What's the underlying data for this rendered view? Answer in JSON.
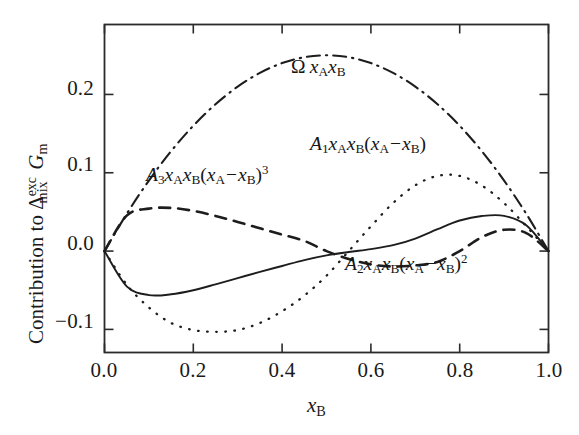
{
  "chart_data": {
    "type": "line",
    "title": "",
    "xlabel": "x_B",
    "ylabel": "Contribution to Δ_mix^exc G_m",
    "xlim": [
      0.0,
      1.0
    ],
    "ylim": [
      -0.1295,
      0.2893
    ],
    "grid": false,
    "legend_position": "inline-annotations",
    "xticks": [
      "0.0",
      "0.2",
      "0.4",
      "0.6",
      "0.8",
      "1.0"
    ],
    "xtick_values": [
      0.0,
      0.2,
      0.4,
      0.6,
      0.8,
      1.0
    ],
    "yticks": [
      "0.2",
      "0.1",
      "0.0",
      "−0.1"
    ],
    "ytick_values": [
      0.2,
      0.1,
      0.0,
      -0.1
    ],
    "x": [
      0.0,
      0.05,
      0.1,
      0.15,
      0.2,
      0.25,
      0.3,
      0.35,
      0.4,
      0.45,
      0.5,
      0.55,
      0.6,
      0.65,
      0.7,
      0.75,
      0.8,
      0.85,
      0.9,
      0.95,
      1.0
    ],
    "series": [
      {
        "name": "Omega xA xB",
        "style": "dash-dot",
        "label": "Ω x_A x_B",
        "values": [
          0.0,
          0.0475,
          0.09,
          0.1275,
          0.16,
          0.1875,
          0.21,
          0.2275,
          0.24,
          0.2475,
          0.25,
          0.2475,
          0.24,
          0.2275,
          0.21,
          0.1875,
          0.16,
          0.1275,
          0.09,
          0.0475,
          0.0
        ]
      },
      {
        "name": "A1 xA xB (xA - xB)",
        "style": "dotted",
        "label": "A_1 x_A x_B (x_A − x_B)",
        "values": [
          0.0,
          -0.0428,
          -0.072,
          -0.0918,
          -0.1008,
          -0.1031,
          -0.1008,
          -0.0918,
          -0.0768,
          -0.0569,
          -0.0315,
          0.0,
          0.0316,
          0.0614,
          0.084,
          0.096,
          0.096,
          0.0836,
          0.0612,
          0.0318,
          0.0
        ]
      },
      {
        "name": "A3 xA xB (xA - xB)^3",
        "style": "dashed",
        "label": "A_3 x_A x_B (x_A − x_B)^3",
        "values": [
          0.0,
          0.0452,
          0.0542,
          0.0551,
          0.0513,
          0.0449,
          0.0372,
          0.0291,
          0.021,
          0.013,
          0.0,
          -0.0101,
          -0.017,
          -0.0197,
          -0.0183,
          -0.0139,
          0.0,
          0.0178,
          0.0272,
          0.023,
          0.0
        ]
      },
      {
        "name": "A2 xA xB (xA - xB)^2",
        "style": "solid",
        "label": "A_2 x_A x_B (x_A − x_B)^2",
        "values": [
          0.0,
          -0.045,
          -0.0562,
          -0.0552,
          -0.05,
          -0.0425,
          -0.0345,
          -0.0265,
          -0.019,
          -0.0115,
          -0.0055,
          -0.0012,
          0.0025,
          0.0075,
          0.016,
          0.028,
          0.039,
          0.0448,
          0.045,
          0.033,
          0.0
        ]
      }
    ]
  },
  "axes": {
    "x_title": "x",
    "x_title_sub": "B",
    "y_title_pre": "Contribution to ",
    "y_title_delta": "Δ",
    "y_title_sup": "exc",
    "y_title_sub": "mix",
    "y_title_g": "G",
    "y_title_g_sub": "m",
    "ytick_labels": [
      "0.2",
      "0.1",
      "0.0",
      "−0.1"
    ],
    "xtick_labels": [
      "0.0",
      "0.2",
      "0.4",
      "0.6",
      "0.8",
      "1.0"
    ]
  },
  "annotations": {
    "omega": {
      "symbol": "Ω",
      "x": "x",
      "sub_a": "A",
      "x2": "x",
      "sub_b": "B"
    },
    "a1": {
      "coef": "A",
      "sub": "1",
      "x1": "x",
      "s1": "A",
      "x2": "x",
      "s2": "B",
      "open": "(",
      "x3": "x",
      "s3": "A",
      "minus": "−",
      "x4": "x",
      "s4": "B",
      "close": ")"
    },
    "a3": {
      "coef": "A",
      "sub": "3",
      "x1": "x",
      "s1": "A",
      "x2": "x",
      "s2": "B",
      "open": "(",
      "x3": "x",
      "s3": "A",
      "minus": "−",
      "x4": "x",
      "s4": "B",
      "close": ")",
      "exp": "3"
    },
    "a2": {
      "coef": "A",
      "sub": "2",
      "x1": "x",
      "s1": "A",
      "x2": "x",
      "s2": "B",
      "open": "(",
      "x3": "x",
      "s3": "A",
      "minus": "−",
      "x4": "x",
      "s4": "B",
      "close": ")",
      "exp": "2"
    }
  }
}
